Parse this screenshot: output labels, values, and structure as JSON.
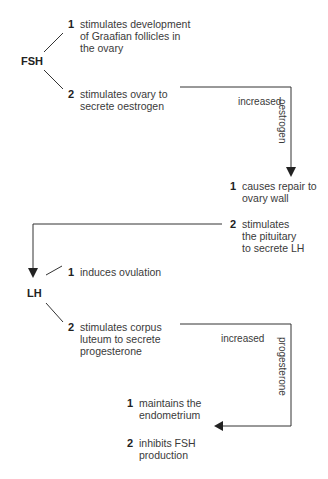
{
  "diagram": {
    "fsh": {
      "label": "FSH",
      "effects": [
        {
          "num": "1",
          "lines": [
            "stimulates development",
            "of Graafian follicles in",
            "the ovary"
          ]
        },
        {
          "num": "2",
          "lines": [
            "stimulates ovary to",
            "secrete oestrogen"
          ]
        }
      ]
    },
    "oestrogen_arrow": {
      "label_h": "increased",
      "label_v": "oestrogen"
    },
    "oestrogen_effects": [
      {
        "num": "1",
        "lines": [
          "causes repair to",
          "ovary wall"
        ]
      },
      {
        "num": "2",
        "lines": [
          "stimulates",
          "the pituitary",
          "to secrete LH"
        ]
      }
    ],
    "lh": {
      "label": "LH",
      "effects": [
        {
          "num": "1",
          "lines": [
            "induces ovulation"
          ]
        },
        {
          "num": "2",
          "lines": [
            "stimulates corpus",
            "luteum to secrete",
            "progesterone"
          ]
        }
      ]
    },
    "progesterone_arrow": {
      "label_h": "increased",
      "label_v": "progesterone"
    },
    "progesterone_effects": [
      {
        "num": "1",
        "lines": [
          "maintains the",
          "endometrium"
        ]
      },
      {
        "num": "2",
        "lines": [
          "inhibits FSH",
          "production"
        ]
      }
    ]
  }
}
